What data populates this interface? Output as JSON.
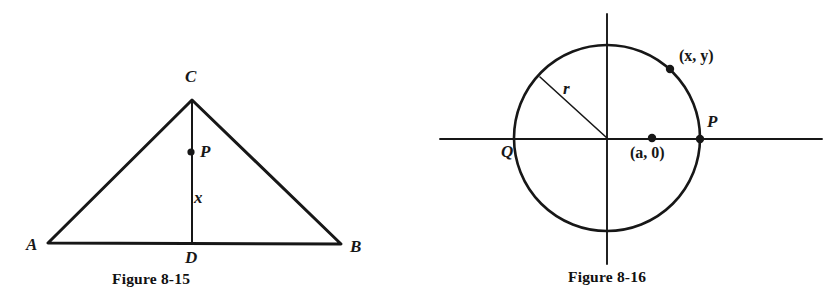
{
  "page": {
    "background_color": "#ffffff",
    "ink_color": "#171717",
    "width": 840,
    "height": 305
  },
  "figures": [
    {
      "id": "figure-8-15",
      "caption": "Figure 8-15",
      "caption_x": 112,
      "caption_y": 270,
      "description": "Triangle ABC with altitude CD and point P on CD",
      "shape": "triangle",
      "vertices": {
        "A": {
          "x": 48,
          "y": 243,
          "label": "A",
          "label_x": 26,
          "label_y": 236
        },
        "B": {
          "x": 341,
          "y": 244,
          "label": "B",
          "label_x": 350,
          "label_y": 238
        },
        "C": {
          "x": 192,
          "y": 100,
          "label": "C",
          "label_x": 185,
          "label_y": 68
        },
        "D": {
          "x": 192,
          "y": 243,
          "label": "D",
          "label_x": 185,
          "label_y": 249
        }
      },
      "points": [
        {
          "name": "P",
          "x": 191,
          "y": 152,
          "label": "P",
          "label_x": 200,
          "label_y": 143,
          "dot_radius": 3.6
        }
      ],
      "segment_labels": [
        {
          "name": "x",
          "text": "x",
          "x": 194,
          "y": 189
        }
      ]
    },
    {
      "id": "figure-8-16",
      "caption": "Figure 8-16",
      "caption_x": 568,
      "caption_y": 268,
      "description": "Circle centered at origin with radius r, x-axis and y-axis, points Q, P, (a, 0) and (x, y)",
      "shape": "circle",
      "circle": {
        "cx": 607,
        "cy": 138,
        "r": 93
      },
      "axes": {
        "x_axis": {
          "x1": 440,
          "y1": 139,
          "x2": 822,
          "y2": 139
        },
        "y_axis": {
          "x1": 607,
          "y1": 14,
          "x2": 607,
          "y2": 264
        }
      },
      "radius_line": {
        "x1": 607,
        "y1": 138,
        "x2": 540,
        "y2": 77,
        "label": "r",
        "label_x": 563,
        "label_y": 80
      },
      "points": [
        {
          "name": "Q",
          "x": 514,
          "y": 139,
          "label": "Q",
          "label_x": 501,
          "label_y": 143,
          "dot_radius": 0
        },
        {
          "name": "P",
          "x": 700,
          "y": 139,
          "label": "P",
          "label_x": 707,
          "label_y": 113,
          "dot_radius": 4.2
        },
        {
          "name": "center-offset",
          "x": 652,
          "y": 138,
          "label": "(a, 0)",
          "label_x": 630,
          "label_y": 145,
          "dot_radius": 4.2
        },
        {
          "name": "xy-point",
          "x": 670,
          "y": 69,
          "label": "(x, y)",
          "label_x": 679,
          "label_y": 48,
          "dot_radius": 4.2
        }
      ]
    }
  ]
}
